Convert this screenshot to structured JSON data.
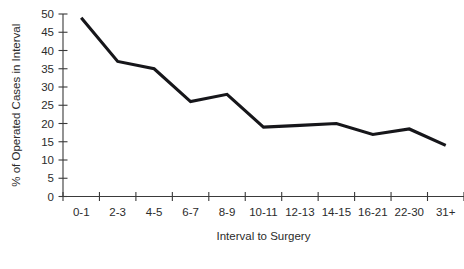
{
  "chart_data": {
    "type": "line",
    "title": "",
    "subtitle": "",
    "xlabel": "Interval to Surgery",
    "ylabel": "% of Operated Cases in Interval",
    "categories": [
      "0-1",
      "2-3",
      "4-5",
      "6-7",
      "8-9",
      "10-11",
      "12-13",
      "14-15",
      "16-21",
      "22-30",
      "31+"
    ],
    "values": [
      49,
      37,
      35,
      26,
      28,
      19,
      19.5,
      20,
      17,
      18.5,
      14
    ],
    "series": [
      {
        "name": "% of Operated Cases in Interval",
        "values": [
          49,
          37,
          35,
          26,
          28,
          19,
          19.5,
          20,
          17,
          18.5,
          14
        ]
      }
    ],
    "ylim": [
      0,
      50
    ],
    "ytick_values": [
      0,
      5,
      10,
      15,
      20,
      25,
      30,
      35,
      40,
      45,
      50
    ],
    "ytick_labels": [
      "0",
      "5",
      "10",
      "15",
      "20",
      "25",
      "30",
      "35",
      "40",
      "45",
      "50"
    ],
    "xtick_labels": [
      "0-1",
      "2-3",
      "4-5",
      "6-7",
      "8-9",
      "10-11",
      "12-13",
      "14-15",
      "16-21",
      "22-30",
      "31+"
    ],
    "grid": false,
    "legend": "none",
    "line_color": "#16161a",
    "axis_color": "#3a3a3a",
    "background_color": "#ffffff",
    "annotations": []
  }
}
